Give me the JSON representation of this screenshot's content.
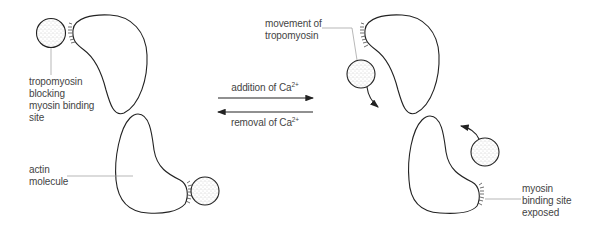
{
  "diagram": {
    "left_state": {
      "label_tropomyosin": [
        "tropomyosin",
        "blocking",
        "myosin binding",
        "site"
      ],
      "label_actin": [
        "actin",
        "molecule"
      ]
    },
    "transition": {
      "forward_label": "addition of Ca",
      "forward_superscript": "2+",
      "reverse_label": "removal of Ca",
      "reverse_superscript": "2+"
    },
    "right_state": {
      "label_movement": [
        "movement of",
        "tropomyosin"
      ],
      "label_site": [
        "myosin",
        "binding site",
        "exposed"
      ]
    },
    "colors": {
      "outline": "#222222",
      "leader": "#999999",
      "stipple": "#9a9a9a"
    }
  }
}
